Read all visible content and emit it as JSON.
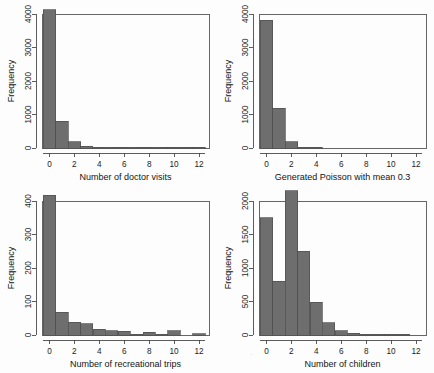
{
  "figure": {
    "title": "",
    "background_color": "#fdfdfd",
    "bar_fill_color": "#6e6e6e",
    "bar_border_color": "#4e4e4e",
    "axis_color": "#4a4a4a",
    "layout": "2x2 grid of histograms"
  },
  "chart_data": [
    {
      "type": "bar",
      "panel": "top-left",
      "title": "",
      "xlabel": "Number of doctor visits",
      "ylabel": "Frequency",
      "categories": [
        0,
        1,
        2,
        3,
        4,
        5,
        6,
        7,
        8,
        9,
        10,
        11,
        12
      ],
      "values": [
        4120,
        800,
        190,
        45,
        20,
        10,
        6,
        4,
        3,
        2,
        1,
        1,
        1
      ],
      "xlim": [
        -0.6,
        12.8
      ],
      "ylim": [
        0,
        4000
      ],
      "xticks": [
        0,
        2,
        4,
        6,
        8,
        10,
        12
      ],
      "yticks": [
        0,
        1000,
        2000,
        3000,
        4000
      ],
      "grid": false,
      "legend": "none"
    },
    {
      "type": "bar",
      "panel": "top-right",
      "title": "",
      "xlabel": "Generated Poisson with mean 0.3",
      "ylabel": "Frequency",
      "categories": [
        0,
        1,
        2,
        3,
        4,
        5,
        6,
        7,
        8,
        9,
        10,
        11,
        12
      ],
      "values": [
        3820,
        1180,
        190,
        18,
        2,
        0,
        0,
        0,
        0,
        0,
        0,
        0,
        0
      ],
      "xlim": [
        -0.6,
        12.8
      ],
      "ylim": [
        0,
        4000
      ],
      "xticks": [
        0,
        2,
        4,
        6,
        8,
        10,
        12
      ],
      "yticks": [
        0,
        1000,
        2000,
        3000,
        4000
      ],
      "grid": false,
      "legend": "none"
    },
    {
      "type": "bar",
      "panel": "bottom-left",
      "title": "",
      "xlabel": "Number of recreational trips",
      "ylabel": "Frequency",
      "categories": [
        0,
        1,
        2,
        3,
        4,
        5,
        6,
        7,
        8,
        9,
        10,
        11,
        12
      ],
      "values": [
        417,
        68,
        38,
        34,
        17,
        13,
        11,
        2,
        8,
        1,
        13,
        0,
        4
      ],
      "xlim": [
        -0.6,
        12.8
      ],
      "ylim": [
        0,
        400
      ],
      "xticks": [
        0,
        2,
        4,
        6,
        8,
        10,
        12
      ],
      "yticks": [
        0,
        100,
        200,
        300,
        400
      ],
      "grid": false,
      "legend": "none"
    },
    {
      "type": "bar",
      "panel": "bottom-right",
      "title": "",
      "xlabel": "Number of children",
      "ylabel": "Frequency",
      "categories": [
        0,
        1,
        2,
        3,
        4,
        5,
        6,
        7,
        8,
        9,
        10,
        11,
        12
      ],
      "values": [
        1750,
        800,
        2150,
        1250,
        490,
        180,
        65,
        28,
        10,
        4,
        2,
        1,
        0
      ],
      "xlim": [
        -0.6,
        12.8
      ],
      "ylim": [
        0,
        2000
      ],
      "xticks": [
        0,
        2,
        4,
        6,
        8,
        10,
        12
      ],
      "yticks": [
        0,
        500,
        1000,
        1500,
        2000
      ],
      "grid": false,
      "legend": "none"
    }
  ]
}
